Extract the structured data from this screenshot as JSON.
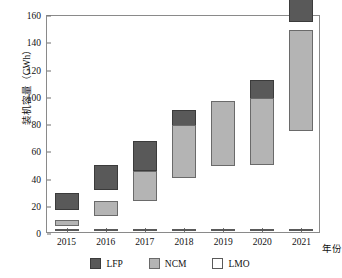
{
  "chart_data": {
    "type": "bar",
    "subtype": "stacked-vertical-bar",
    "title": "",
    "xlabel": "年份",
    "ylabel": "装机容量（GWh）",
    "categories": [
      "2015",
      "2016",
      "2017",
      "2018",
      "2019",
      "2020",
      "2021"
    ],
    "series": [
      {
        "name": "LFP",
        "color": "#595959",
        "values": [
          12,
          19,
          22,
          25,
          22,
          31,
          80
        ]
      },
      {
        "name": "NCM",
        "color": "#b4b4b4",
        "values": [
          4,
          11,
          22,
          39,
          48,
          49,
          74
        ]
      },
      {
        "name": "LMO",
        "color": "#ffffff",
        "values": [
          0.5,
          0.5,
          0.5,
          0.5,
          0.5,
          0.5,
          0.5
        ]
      }
    ],
    "totals": [
      16.5,
      30.5,
      44.5,
      64.5,
      70.5,
      80.5,
      154.5
    ],
    "ylim": [
      0,
      160
    ],
    "yticks": [
      0,
      20,
      40,
      60,
      80,
      100,
      120,
      140,
      160
    ],
    "ytick_labels": [
      "0",
      "20",
      "40",
      "60",
      "80",
      "100",
      "120",
      "140",
      "160"
    ],
    "xtick_labels": [
      "2015",
      "2016",
      "2017",
      "2018",
      "2019",
      "2020",
      "2021"
    ],
    "grid": false,
    "legend": {
      "position": "bottom-center",
      "entries": [
        {
          "label": "LFP",
          "color": "#595959"
        },
        {
          "label": "NCM",
          "color": "#b4b4b4"
        },
        {
          "label": "LMO",
          "color": "#ffffff"
        }
      ]
    }
  }
}
